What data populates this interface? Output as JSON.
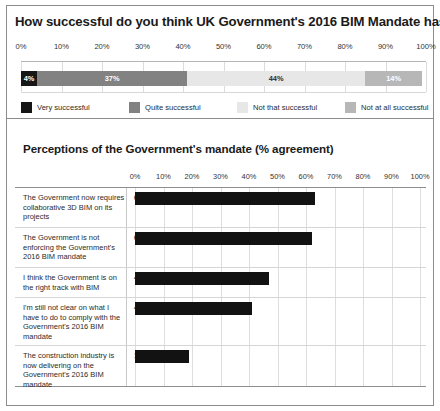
{
  "top_chart": {
    "title": "How successful do you think UK Government's 2016 BIM Mandate has been?",
    "axis_ticks": [
      "0%",
      "10%",
      "20%",
      "30%",
      "40%",
      "50%",
      "60%",
      "70%",
      "80%",
      "90%",
      "100%"
    ],
    "segments": [
      {
        "label": "Very successful",
        "value": 4,
        "value_label": "4%",
        "color": "#161616"
      },
      {
        "label": "Quite successful",
        "value": 37,
        "value_label": "37%",
        "color": "#828282"
      },
      {
        "label": "Not that successful",
        "value": 44,
        "value_label": "44%",
        "color": "#e7e7e7"
      },
      {
        "label": "Not at all successful",
        "value": 14,
        "value_label": "14%",
        "color": "#b7b7b7"
      }
    ]
  },
  "bottom_chart": {
    "title": "Perceptions of the Government's mandate (% agreement)",
    "axis_ticks": [
      "0%",
      "10%",
      "20%",
      "30%",
      "40%",
      "50%",
      "60%",
      "70%",
      "80%",
      "90%",
      "100%"
    ],
    "bar_color": "#121212",
    "rows": [
      {
        "label": "The Government now requires collaborative 3D BIM on its projects",
        "value": 63,
        "value_label": "63%"
      },
      {
        "label": "The Government is not enforcing the Government's 2016 BIM mandate",
        "value": 62,
        "value_label": "62%"
      },
      {
        "label": "I think the Government is on the right track with BIM",
        "value": 47,
        "value_label": "47%"
      },
      {
        "label": "I'm still not clear on what I have to do to comply with the Government's 2016 BIM mandate",
        "value": 41,
        "value_label": "41%"
      },
      {
        "label": "The construction industry is now delivering on the Government's 2016 BIM mandate",
        "value": 19,
        "value_label": "19%"
      }
    ]
  },
  "chart_data": [
    {
      "type": "bar",
      "orientation": "horizontal-stacked",
      "title": "How successful do you think UK Government's 2016 BIM Mandate has been?",
      "categories": [
        "Very successful",
        "Quite successful",
        "Not that successful",
        "Not at all successful"
      ],
      "values": [
        4,
        37,
        44,
        14
      ],
      "xlabel": "",
      "ylabel": "",
      "xlim": [
        0,
        100
      ],
      "xticks": [
        0,
        10,
        20,
        30,
        40,
        50,
        60,
        70,
        80,
        90,
        100
      ],
      "grid": true,
      "legend_position": "bottom",
      "colors": [
        "#161616",
        "#828282",
        "#e7e7e7",
        "#b7b7b7"
      ]
    },
    {
      "type": "bar",
      "orientation": "horizontal",
      "title": "Perceptions of the Government's mandate (% agreement)",
      "categories": [
        "The Government now requires collaborative 3D BIM on its projects",
        "The Government is not enforcing the Government's 2016 BIM mandate",
        "I think the Government is on the right track with BIM",
        "I'm still not clear on what I have to do to comply with the Government's 2016 BIM mandate",
        "The construction industry is now delivering on the Government's 2016 BIM mandate"
      ],
      "values": [
        63,
        62,
        47,
        41,
        19
      ],
      "xlabel": "",
      "ylabel": "",
      "xlim": [
        0,
        100
      ],
      "xticks": [
        0,
        10,
        20,
        30,
        40,
        50,
        60,
        70,
        80,
        90,
        100
      ],
      "grid": true,
      "legend_position": "none",
      "colors": [
        "#121212"
      ]
    }
  ]
}
